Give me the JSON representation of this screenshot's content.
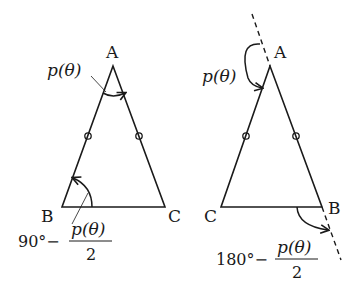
{
  "figures": [
    {
      "id": "left",
      "vertices": {
        "top": "A",
        "bottom_left": "B",
        "bottom_right": "C"
      },
      "apex_angle_label": "p(θ)",
      "base_angle_label": {
        "prefix": "90°−",
        "numerator": "p(θ)",
        "denominator": "2"
      },
      "equal_side_marks": "o"
    },
    {
      "id": "right",
      "vertices": {
        "top": "A",
        "bottom_left": "C",
        "bottom_right": "B"
      },
      "apex_angle_label": "p(θ)",
      "base_angle_label": {
        "prefix": "180°−",
        "numerator": "p(θ)",
        "denominator": "2"
      },
      "equal_side_marks": "o",
      "extended_line": "dashed"
    }
  ],
  "colors": {
    "stroke": "#1a1a1a",
    "background": "#ffffff"
  }
}
